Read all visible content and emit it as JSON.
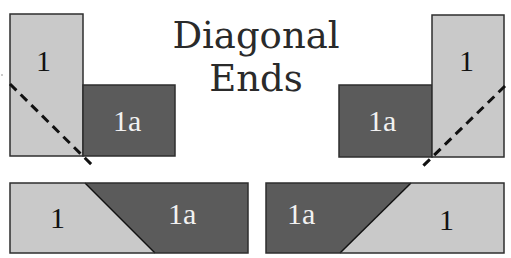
{
  "title": "Diagonal Ends",
  "colors": {
    "light_patch": "#c9c9c9",
    "dark_patch": "#5b5b5b",
    "border": "#2e2e2e",
    "dashed_line": "#111111"
  },
  "diagrams": {
    "top_left": {
      "piece_1": "1",
      "piece_1a": "1a"
    },
    "top_right": {
      "piece_1": "1",
      "piece_1a": "1a"
    },
    "bottom_left": {
      "piece_1": "1",
      "piece_1a": "1a"
    },
    "bottom_right": {
      "piece_1": "1",
      "piece_1a": "1a"
    }
  }
}
